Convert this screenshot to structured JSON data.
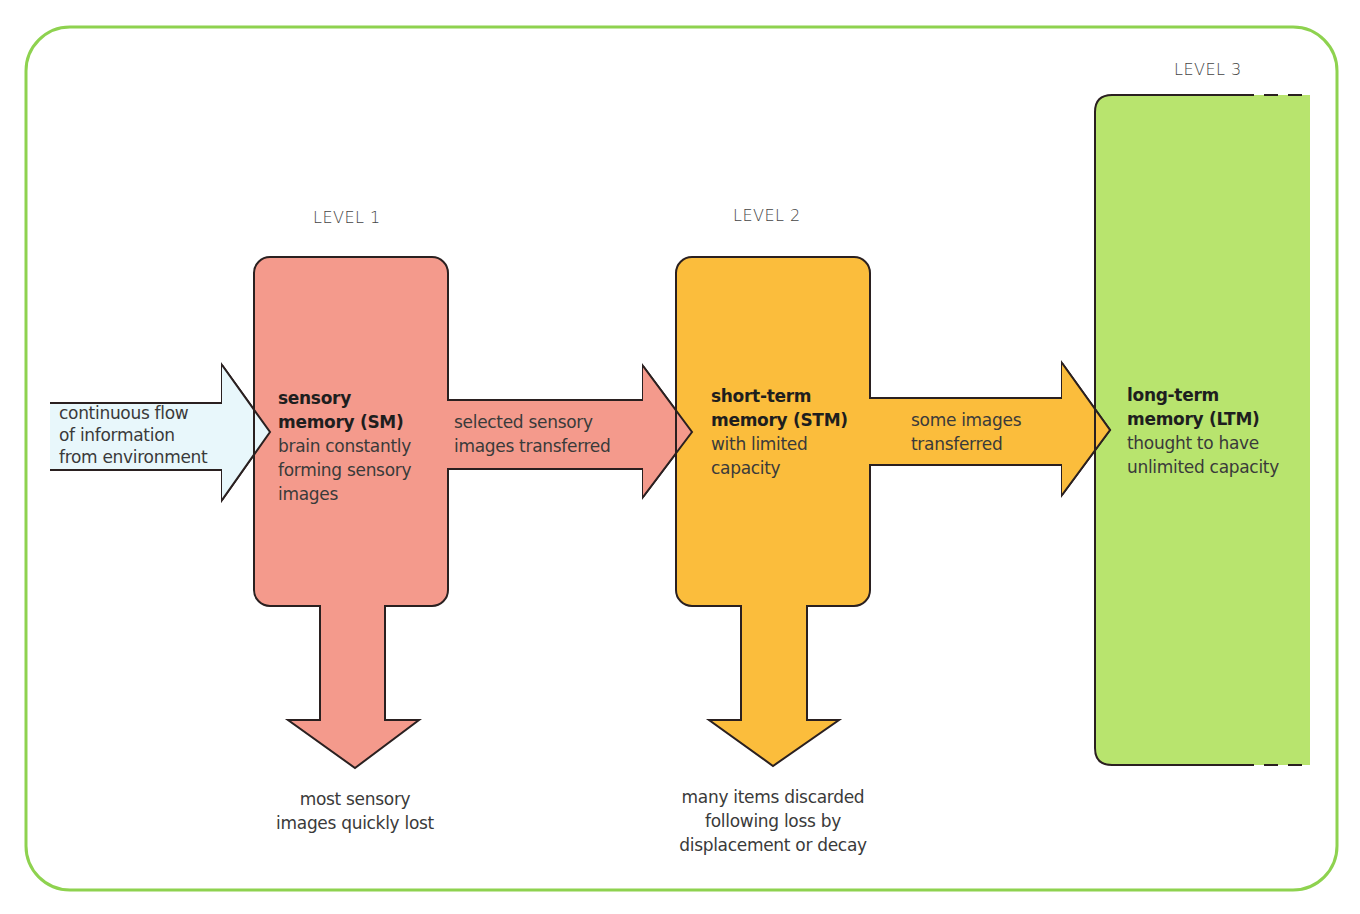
{
  "colors": {
    "frame": "#8ed24f",
    "input_arrow": "#e8f7fb",
    "sensory": "#f49a8c",
    "short_term": "#fbbd3c",
    "long_term": "#b8e46e",
    "outline": "#2a2020",
    "text": "#3a3a3a"
  },
  "levels": {
    "level1": "LEVEL 1",
    "level2": "LEVEL 2",
    "level3": "LEVEL 3"
  },
  "input": {
    "line1": "continuous flow",
    "line2": "of information",
    "line3": "from environment"
  },
  "sensory_memory": {
    "title1": "sensory",
    "title2": "memory (SM)",
    "desc1": "brain constantly",
    "desc2": "forming sensory",
    "desc3": "images"
  },
  "sm_to_stm": {
    "line1": "selected sensory",
    "line2": "images transferred"
  },
  "short_term_memory": {
    "title1": "short-term",
    "title2": "memory (STM)",
    "desc1": "with limited",
    "desc2": "capacity"
  },
  "stm_to_ltm": {
    "line1": "some images",
    "line2": "transferred"
  },
  "long_term_memory": {
    "title1": "long-term",
    "title2": "memory (LTM)",
    "desc1": "thought to have",
    "desc2": "unlimited capacity"
  },
  "sm_loss": {
    "line1": "most sensory",
    "line2": "images quickly lost"
  },
  "stm_loss": {
    "line1": "many items discarded",
    "line2": "following loss by",
    "line3": "displacement or decay"
  }
}
